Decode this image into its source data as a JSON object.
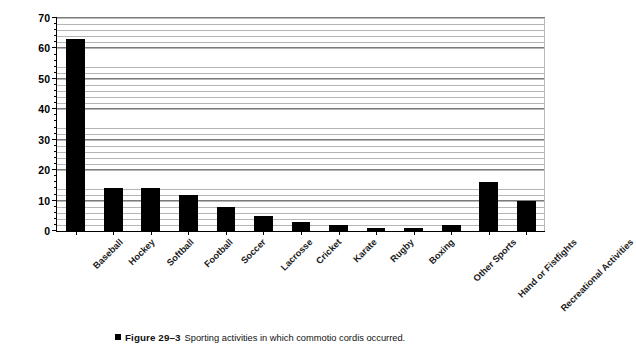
{
  "chart_data": {
    "type": "bar",
    "title": "",
    "xlabel": "",
    "ylabel": "No. of Cases",
    "ylim": [
      0,
      70
    ],
    "ytick_step": 10,
    "yminor_step": 2,
    "grid": true,
    "legend": "none",
    "orientation": "vertical",
    "bar_color": "#000000",
    "categories": [
      "Baseball",
      "Hockey",
      "Softball",
      "Football",
      "Soccer",
      "Lacrosse",
      "Cricket",
      "Karate",
      "Rugby",
      "Boxing",
      "Other Sports",
      "Hand or Fistfights",
      "Recreational Activities"
    ],
    "values": [
      63,
      14,
      14,
      12,
      8,
      5,
      3,
      2,
      1,
      1,
      2,
      16,
      10
    ],
    "ytick_labels": [
      "0",
      "10",
      "20",
      "30",
      "40",
      "50",
      "60",
      "70"
    ],
    "ytick_values": [
      0,
      10,
      20,
      30,
      40,
      50,
      60,
      70
    ]
  },
  "caption": {
    "marker": "square-marker",
    "figure_number": "Figure 29–3",
    "text": "Sporting activities in which commotio cordis occurred."
  }
}
